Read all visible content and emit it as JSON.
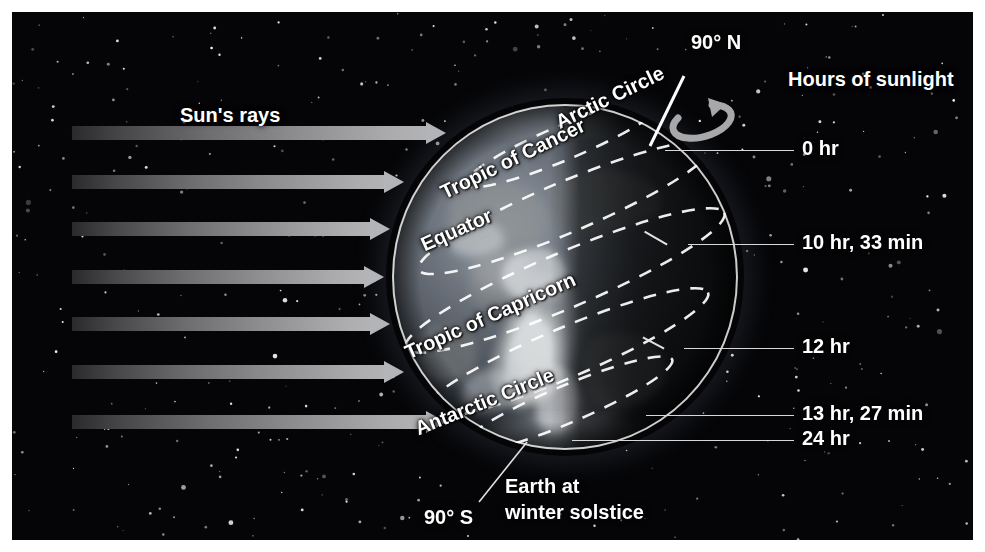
{
  "figure": {
    "background_color": "#050507",
    "page_color": "#ffffff"
  },
  "labels": {
    "sun_rays": "Sun's rays",
    "hours_of_sunlight": "Hours of sunlight",
    "north_pole": "90° N",
    "south_pole": "90° S",
    "caption_line1": "Earth at",
    "caption_line2": "winter solstice"
  },
  "latitude_lines": [
    {
      "name": "Arctic Circle",
      "label": "Arctic Circle"
    },
    {
      "name": "Tropic of Cancer",
      "label": "Tropic of Cancer"
    },
    {
      "name": "Equator",
      "label": "Equator"
    },
    {
      "name": "Tropic of Capricorn",
      "label": "Tropic of Capricorn"
    },
    {
      "name": "Antarctic Circle",
      "label": "Antarctic Circle"
    }
  ],
  "sunlight_readings": [
    {
      "latitude": "Arctic Circle",
      "value": "0 hr"
    },
    {
      "latitude": "Tropic of Cancer",
      "value": "10 hr, 33 min"
    },
    {
      "latitude": "Equator",
      "value": "12 hr"
    },
    {
      "latitude": "Tropic of Capricorn",
      "value": "13 hr, 27 min"
    },
    {
      "latitude": "Antarctic Circle",
      "value": "24 hr"
    }
  ],
  "chart_data": {
    "type": "diagram",
    "categories": [
      "Arctic Circle",
      "Tropic of Cancer",
      "Equator",
      "Tropic of Capricorn",
      "Antarctic Circle"
    ],
    "value_labels": [
      "0 hr",
      "10 hr, 33 min",
      "12 hr",
      "13 hr, 27 min",
      "24 hr"
    ],
    "values_hours": [
      0,
      10.55,
      12,
      13.45,
      24
    ],
    "ylabel": "Hours of sunlight",
    "annotations": [
      "Sun's rays",
      "90° N",
      "90° S",
      "Earth at winter solstice"
    ]
  },
  "colors": {
    "ray_tip": "#b5b5b7",
    "ray_base": "#2a2a2c",
    "text": "#ffffff",
    "leader": "#d8d8d8"
  }
}
